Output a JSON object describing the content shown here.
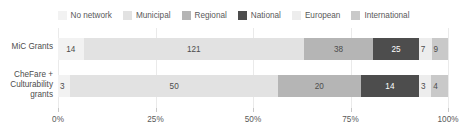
{
  "chart_data": {
    "type": "bar",
    "orientation": "horizontal",
    "stacked": true,
    "normalized": true,
    "title": "",
    "subtitle": "",
    "xlabel": "",
    "ylabel": "",
    "xlim": [
      0,
      100
    ],
    "xunit": "%",
    "grid": true,
    "legend_position": "top",
    "xticks": [
      {
        "value": 0,
        "label": "0%"
      },
      {
        "value": 25,
        "label": "25%"
      },
      {
        "value": 50,
        "label": "50%"
      },
      {
        "value": 75,
        "label": "75%"
      },
      {
        "value": 100,
        "label": "100%"
      }
    ],
    "categories": [
      "MiC Grants",
      "CheFare +\nCulturability\ngrants"
    ],
    "series": [
      {
        "name": "No network",
        "color": "#f2f2f2",
        "values": [
          14,
          3
        ]
      },
      {
        "name": "Municipal",
        "color": "#e2e2e2",
        "values": [
          121,
          50
        ]
      },
      {
        "name": "Regional",
        "color": "#b5b5b5",
        "values": [
          38,
          20
        ]
      },
      {
        "name": "National",
        "color": "#4d4d4d",
        "values": [
          25,
          14
        ]
      },
      {
        "name": "European",
        "color": "#ededed",
        "values": [
          7,
          3
        ]
      },
      {
        "name": "International",
        "color": "#c9c9c9",
        "values": [
          9,
          4
        ]
      }
    ],
    "row_totals": [
      214,
      94
    ]
  },
  "legend": {
    "items": [
      {
        "label": "No network",
        "color": "#f2f2f2"
      },
      {
        "label": "Municipal",
        "color": "#e2e2e2"
      },
      {
        "label": "Regional",
        "color": "#b5b5b5"
      },
      {
        "label": "National",
        "color": "#4d4d4d"
      },
      {
        "label": "European",
        "color": "#ededed"
      },
      {
        "label": "International",
        "color": "#c9c9c9"
      }
    ]
  },
  "rows": [
    {
      "category": "MiC Grants",
      "segments": [
        {
          "series": "No network",
          "value": 14,
          "label": "14",
          "color": "#f2f2f2",
          "text_on_dark": false
        },
        {
          "series": "Municipal",
          "value": 121,
          "label": "121",
          "color": "#e2e2e2",
          "text_on_dark": false
        },
        {
          "series": "Regional",
          "value": 38,
          "label": "38",
          "color": "#b5b5b5",
          "text_on_dark": false
        },
        {
          "series": "National",
          "value": 25,
          "label": "25",
          "color": "#4d4d4d",
          "text_on_dark": true
        },
        {
          "series": "European",
          "value": 7,
          "label": "7",
          "color": "#ededed",
          "text_on_dark": false
        },
        {
          "series": "International",
          "value": 9,
          "label": "9",
          "color": "#c9c9c9",
          "text_on_dark": false
        }
      ]
    },
    {
      "category": "CheFare +\nCulturability\ngrants",
      "segments": [
        {
          "series": "No network",
          "value": 3,
          "label": "3",
          "color": "#f2f2f2",
          "text_on_dark": false
        },
        {
          "series": "Municipal",
          "value": 50,
          "label": "50",
          "color": "#e2e2e2",
          "text_on_dark": false
        },
        {
          "series": "Regional",
          "value": 20,
          "label": "20",
          "color": "#b5b5b5",
          "text_on_dark": false
        },
        {
          "series": "National",
          "value": 14,
          "label": "14",
          "color": "#4d4d4d",
          "text_on_dark": true
        },
        {
          "series": "European",
          "value": 3,
          "label": "3",
          "color": "#ededed",
          "text_on_dark": false
        },
        {
          "series": "International",
          "value": 4,
          "label": "4",
          "color": "#c9c9c9",
          "text_on_dark": false
        }
      ]
    }
  ],
  "axis": {
    "ticks": [
      "0%",
      "25%",
      "50%",
      "75%",
      "100%"
    ]
  }
}
